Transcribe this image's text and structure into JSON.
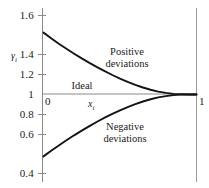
{
  "chart_data": {
    "type": "line",
    "title": "",
    "xlabel": "x_i",
    "ylabel": "gamma_i",
    "xlim": [
      0,
      1
    ],
    "ylim": [
      0.4,
      1.6
    ],
    "grid": false,
    "legend": "none",
    "x_ticks": [
      "0",
      "1"
    ],
    "y_ticks": [
      "1.6",
      "1.4",
      "1.2",
      "1",
      "0.8",
      "0.6",
      "0.4"
    ],
    "series": [
      {
        "name": "Positive deviations",
        "x": [
          0.0,
          0.05,
          0.1,
          0.15,
          0.2,
          0.25,
          0.3,
          0.35,
          0.4,
          0.45,
          0.5,
          0.55,
          0.6,
          0.65,
          0.7,
          0.75,
          0.8,
          0.85,
          0.9,
          0.95,
          1.0
        ],
        "values": [
          1.47,
          1.427,
          1.386,
          1.347,
          1.31,
          1.274,
          1.24,
          1.208,
          1.177,
          1.148,
          1.121,
          1.096,
          1.073,
          1.053,
          1.036,
          1.022,
          1.012,
          1.005,
          1.002,
          1.0,
          1.0
        ]
      },
      {
        "name": "Negative deviations",
        "x": [
          0.0,
          0.05,
          0.1,
          0.15,
          0.2,
          0.25,
          0.3,
          0.35,
          0.4,
          0.45,
          0.5,
          0.55,
          0.6,
          0.65,
          0.7,
          0.75,
          0.8,
          0.85,
          0.9,
          0.95,
          1.0
        ],
        "values": [
          0.53,
          0.572,
          0.613,
          0.652,
          0.69,
          0.726,
          0.76,
          0.793,
          0.824,
          0.853,
          0.879,
          0.904,
          0.927,
          0.947,
          0.964,
          0.978,
          0.988,
          0.995,
          0.999,
          1.0,
          1.0
        ]
      },
      {
        "name": "Ideal",
        "x": [
          0.0,
          1.0
        ],
        "values": [
          1.0,
          1.0
        ]
      }
    ],
    "annotations": [
      {
        "id": "positive",
        "line1": "Positive",
        "line2": "deviations"
      },
      {
        "id": "negative",
        "line1": "Negative",
        "line2": "deviations"
      },
      {
        "id": "ideal",
        "line1": "Ideal",
        "line2": ""
      }
    ]
  },
  "axes": {
    "y_label_symbol": "γ",
    "y_label_subscript": "i",
    "x_label_symbol": "x",
    "x_label_subscript": "i",
    "y_ticks": [
      {
        "label": "1.6",
        "value": 1.6
      },
      {
        "label": "1.4",
        "value": 1.4
      },
      {
        "label": "1.2",
        "value": 1.2
      },
      {
        "label": "1",
        "value": 1.0
      },
      {
        "label": "0.8",
        "value": 0.8
      },
      {
        "label": "0.6",
        "value": 0.6
      },
      {
        "label": "0.4",
        "value": 0.4
      }
    ],
    "x_ticks": [
      {
        "label": "0",
        "value": 0
      },
      {
        "label": "1",
        "value": 1
      }
    ]
  },
  "colors": {
    "curve": "#141414",
    "axis": "#8a8a8a",
    "ideal_line": "#8a8a8a",
    "text": "#1a1a1a",
    "background": "#ffffff"
  }
}
